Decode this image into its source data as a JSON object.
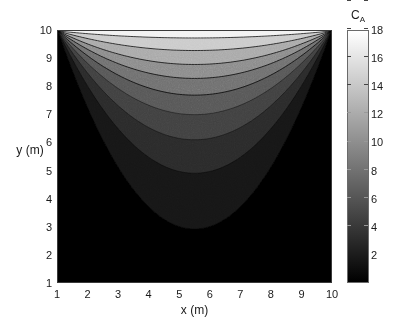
{
  "figure": {
    "background": "#ffffff",
    "width": 410,
    "height": 327
  },
  "axes": {
    "x": {
      "label": "x (m)",
      "min": 1,
      "max": 10,
      "ticks": [
        "1",
        "2",
        "3",
        "4",
        "5",
        "6",
        "7",
        "8",
        "9",
        "10"
      ],
      "tick_values": [
        1,
        2,
        3,
        4,
        5,
        6,
        7,
        8,
        9,
        10
      ]
    },
    "y": {
      "label": "y (m)",
      "min": 1,
      "max": 10,
      "ticks": [
        "1",
        "2",
        "3",
        "4",
        "5",
        "6",
        "7",
        "8",
        "9",
        "10"
      ],
      "tick_values": [
        1,
        2,
        3,
        4,
        5,
        6,
        7,
        8,
        9,
        10
      ]
    }
  },
  "colorbar": {
    "title_main": "C",
    "title_sub": "A",
    "min": 0,
    "max": 18,
    "ticks": [
      "2",
      "4",
      "6",
      "8",
      "10",
      "12",
      "14",
      "16",
      "18"
    ],
    "tick_values": [
      2,
      4,
      6,
      8,
      10,
      12,
      14,
      16,
      18
    ],
    "colormap": "grayscale",
    "low_color": "#000000",
    "high_color": "#ffffff"
  },
  "chart_data": {
    "type": "heatmap",
    "title": "",
    "xlabel": "x (m)",
    "ylabel": "y (m)",
    "zlabel": "C_A",
    "xlim": [
      1,
      10
    ],
    "ylim": [
      1,
      10
    ],
    "zlim": [
      0,
      18
    ],
    "grid": false,
    "legend_position": "right-colorbar",
    "colormap": "gray",
    "contour_levels": [
      2,
      4,
      6,
      8,
      10,
      12,
      14,
      16,
      18
    ],
    "level_fill_colors": [
      "#050505",
      "#171717",
      "#2b2b2b",
      "#3f3f3f",
      "#565656",
      "#6e6e6e",
      "#8a8a8a",
      "#a8a8a8",
      "#cacaca",
      "#f2f2f2"
    ],
    "contour_line_color": "#000000",
    "boundary_values": {
      "top_edge_center": 18,
      "top_edge_corners": 12,
      "bottom_edge": 0,
      "left_edge_top": 12,
      "right_edge_top": 12
    },
    "contour_vertex_x": 5.5,
    "contour_vertex_y_by_level": [
      {
        "level": 2,
        "vertex_y": 2.9
      },
      {
        "level": 4,
        "vertex_y": 4.9
      },
      {
        "level": 6,
        "vertex_y": 6.1
      },
      {
        "level": 8,
        "vertex_y": 7.0
      },
      {
        "level": 10,
        "vertex_y": 7.7
      },
      {
        "level": 12,
        "vertex_y": 8.3
      },
      {
        "level": 14,
        "vertex_y": 8.8
      },
      {
        "level": 16,
        "vertex_y": 9.3
      },
      {
        "level": 18,
        "vertex_y": 9.75
      }
    ],
    "x": [
      1,
      2,
      3,
      4,
      5,
      6,
      7,
      8,
      9,
      10
    ],
    "y": [
      1,
      2,
      3,
      4,
      5,
      6,
      7,
      8,
      9,
      10
    ],
    "z": [
      [
        0.0,
        0.0,
        0.0,
        0.0,
        0.0,
        0.0,
        0.0,
        0.0,
        0.0,
        0.0
      ],
      [
        0.2,
        0.3,
        0.4,
        0.5,
        0.5,
        0.5,
        0.5,
        0.4,
        0.3,
        0.2
      ],
      [
        0.7,
        1.0,
        1.4,
        1.7,
        1.9,
        1.9,
        1.8,
        1.5,
        1.1,
        0.8
      ],
      [
        1.6,
        2.3,
        3.1,
        3.7,
        4.0,
        4.0,
        3.8,
        3.3,
        2.5,
        1.7
      ],
      [
        2.9,
        4.0,
        5.2,
        6.0,
        6.4,
        6.4,
        6.1,
        5.4,
        4.3,
        3.1
      ],
      [
        4.5,
        6.0,
        7.4,
        8.4,
        8.9,
        8.9,
        8.6,
        7.7,
        6.3,
        4.7
      ],
      [
        6.3,
        8.0,
        9.6,
        10.7,
        11.2,
        11.2,
        10.9,
        9.9,
        8.4,
        6.6
      ],
      [
        8.2,
        10.0,
        11.7,
        12.8,
        13.3,
        13.3,
        13.0,
        12.0,
        10.4,
        8.5
      ],
      [
        10.1,
        12.0,
        13.7,
        14.8,
        15.4,
        15.4,
        15.1,
        14.1,
        12.4,
        10.4
      ],
      [
        12.0,
        14.0,
        15.8,
        17.0,
        17.8,
        17.9,
        17.4,
        16.2,
        14.4,
        12.2
      ]
    ]
  }
}
